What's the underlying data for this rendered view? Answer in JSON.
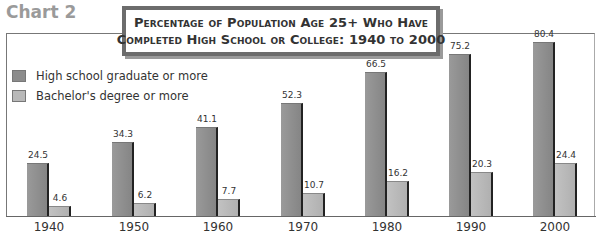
{
  "header": {
    "chart_label": "Chart 2",
    "title_line1": "Percentage of Population Age 25+ Who Have",
    "title_line2": "Completed High School or College: 1940 to 2000"
  },
  "legend": [
    {
      "label": "High school graduate or more",
      "color": "#8c8c8c"
    },
    {
      "label": "Bachelor's degree or more",
      "color": "#b8b8b8"
    }
  ],
  "colors": {
    "high_school": "#8c8c8c",
    "bachelors": "#b8b8b8",
    "bar_edge": "#222222",
    "title_border": "#6c6c6c"
  },
  "chart_data": {
    "type": "bar",
    "title": "Percentage of Population Age 25+ Who Have Completed High School or College: 1940 to 2000",
    "categories": [
      "1940",
      "1950",
      "1960",
      "1970",
      "1980",
      "1990",
      "2000"
    ],
    "series": [
      {
        "name": "High school graduate or more",
        "values": [
          24.5,
          34.3,
          41.1,
          52.3,
          66.5,
          75.2,
          80.4
        ]
      },
      {
        "name": "Bachelor's degree or more",
        "values": [
          4.6,
          6.2,
          7.7,
          10.7,
          16.2,
          20.3,
          24.4
        ]
      }
    ],
    "value_labels": {
      "hs": [
        "24.5",
        "34.3",
        "41.1",
        "52.3",
        "66.5",
        "75.2",
        "80.4"
      ],
      "ba": [
        "4.6",
        "6.2",
        "7.7",
        "10.7",
        "16.2",
        "20.3",
        "24.4"
      ]
    },
    "xlabel": "",
    "ylabel": "",
    "ylim": [
      0,
      85
    ],
    "grid": false,
    "legend_position": "upper-left"
  }
}
